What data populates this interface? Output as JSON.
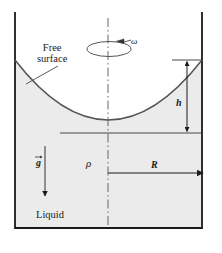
{
  "figure": {
    "labels": {
      "free_surface_line1": "Free",
      "free_surface_line2": "surface",
      "liquid": "Liquid",
      "omega": "ω",
      "rho": "ρ",
      "height": "h",
      "radius": "R",
      "gravity": "g"
    },
    "colors": {
      "liquid_fill": "#ebebeb",
      "wall": "#1a1a1a",
      "curve": "#4a4a4a",
      "centerline": "#555555",
      "text": "#1a1a1a"
    },
    "geometry": {
      "container_left_x": 15,
      "container_right_x": 202,
      "container_top_y": 13,
      "container_bottom_y": 228,
      "center_x": 108,
      "curve_edge_y": 60,
      "curve_vertex_y": 120,
      "radius_line_y": 173,
      "h_arrow_x": 187,
      "gravity_arrow_x": 45
    }
  }
}
